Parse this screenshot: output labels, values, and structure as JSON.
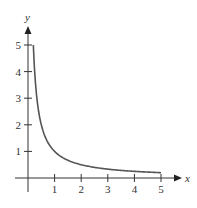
{
  "chart_data": {
    "type": "line",
    "title": "",
    "xlabel": "x",
    "ylabel": "y",
    "xlim": [
      0,
      5
    ],
    "ylim": [
      0,
      5
    ],
    "grid": false,
    "legend": null,
    "x_ticks": [
      "1",
      "2",
      "3",
      "4",
      "5"
    ],
    "y_ticks": [
      "1",
      "2",
      "3",
      "4",
      "5"
    ],
    "series": [
      {
        "name": "y = 1/x",
        "color": "#555555",
        "x": [
          0.2,
          0.25,
          0.3,
          0.4,
          0.5,
          0.75,
          1,
          1.5,
          2,
          2.5,
          3,
          3.5,
          4,
          4.5,
          5
        ],
        "y": [
          5,
          4,
          3.33,
          2.5,
          2,
          1.33,
          1,
          0.67,
          0.5,
          0.4,
          0.33,
          0.29,
          0.25,
          0.22,
          0.2
        ]
      }
    ]
  },
  "axes": {
    "x_label": "x",
    "y_label": "y",
    "x_ticks": [
      "1",
      "2",
      "3",
      "4",
      "5"
    ],
    "y_ticks": [
      "1",
      "2",
      "3",
      "4",
      "5"
    ],
    "axis_color": "#333333"
  }
}
